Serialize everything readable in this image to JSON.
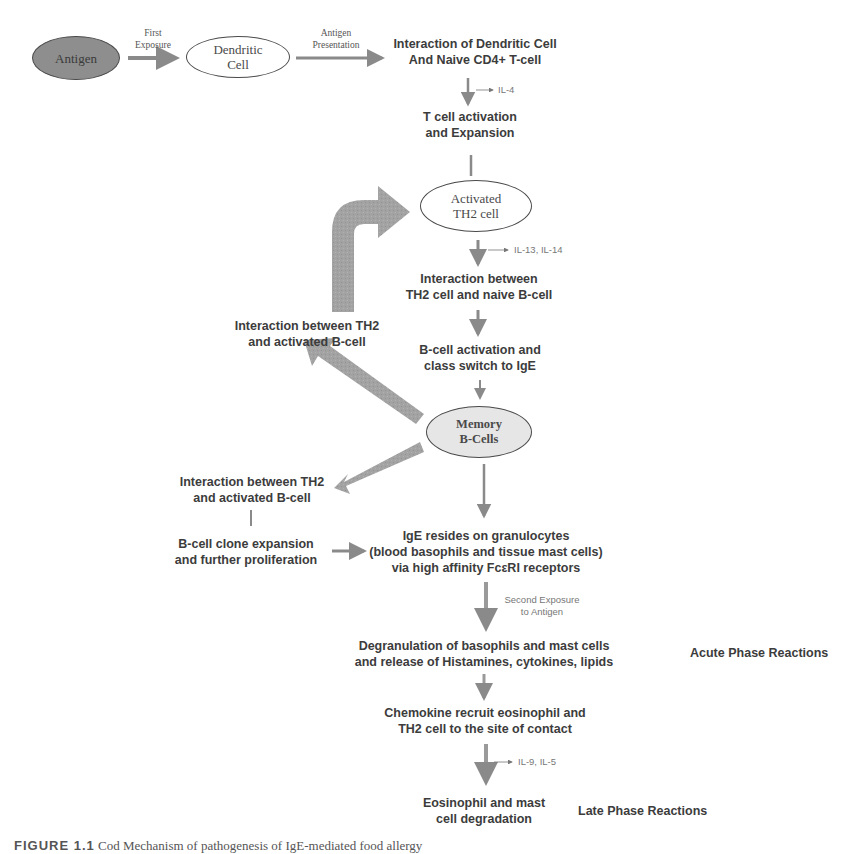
{
  "diagram": {
    "colors": {
      "arrow_fill": "#9a9a9a",
      "antigen_fill": "#8e8e8e",
      "memory_fill": "#e6e6e6",
      "text": "#3c3c3c"
    },
    "nodes": {
      "antigen": {
        "lines": [
          "Antigen"
        ],
        "shape": "ellipse-filled"
      },
      "dendritic_cell": {
        "lines": [
          "Dendritic",
          "Cell"
        ],
        "shape": "ellipse"
      },
      "interaction_dc_tcell": {
        "lines": [
          "Interaction of Dendritic Cell",
          "And Naive CD4+ T-cell"
        ]
      },
      "tcell_activation": {
        "lines": [
          "T cell activation",
          "and Expansion"
        ]
      },
      "activated_th2": {
        "lines": [
          "Activated",
          "TH2 cell"
        ],
        "shape": "ellipse"
      },
      "interaction_th2_naive_b": {
        "lines": [
          "Interaction between",
          "TH2 cell and naive B-cell"
        ]
      },
      "bcell_activation": {
        "lines": [
          "B-cell activation  and",
          "class switch to IgE"
        ]
      },
      "memory_bcells": {
        "lines": [
          "Memory",
          "B-Cells"
        ],
        "shape": "ellipse-filled-light"
      },
      "interaction_th2_activated_b_upper": {
        "lines": [
          "Interaction between TH2",
          "and activated B-cell"
        ]
      },
      "interaction_th2_activated_b_lower": {
        "lines": [
          "Interaction between TH2",
          "and activated B-cell"
        ]
      },
      "bcell_clone_expansion": {
        "lines": [
          "B-cell clone expansion",
          "and further proliferation"
        ]
      },
      "ige_granulocytes": {
        "lines": [
          "IgE resides on granulocytes",
          "(blood basophils and tissue mast cells)",
          "via high affinity FcεRI receptors"
        ]
      },
      "degranulation": {
        "lines": [
          "Degranulation of basophils and mast cells",
          "and release of Histamines, cytokines, lipids"
        ]
      },
      "chemokine_recruit": {
        "lines": [
          "Chemokine recruit eosinophil and",
          "TH2 cell to the site of contact"
        ]
      },
      "eosinophil_degradation": {
        "lines": [
          "Eosinophil and mast",
          "cell degradation"
        ]
      }
    },
    "edge_labels": {
      "first_exposure": [
        "First",
        "Exposure"
      ],
      "antigen_presentation": [
        "Antigen",
        "Presentation"
      ],
      "second_exposure": [
        "Second Exposure",
        "to Antigen"
      ]
    },
    "cytokines": {
      "il4": "IL-4",
      "il13_il14": "IL-13, IL-14",
      "il9_il5": "IL-9, IL-5"
    },
    "phase_labels": {
      "acute": "Acute Phase Reactions",
      "late": "Late Phase Reactions"
    },
    "edges": [
      {
        "from": "antigen",
        "to": "dendritic_cell",
        "label": "first_exposure"
      },
      {
        "from": "dendritic_cell",
        "to": "interaction_dc_tcell",
        "label": "antigen_presentation"
      },
      {
        "from": "interaction_dc_tcell",
        "to": "tcell_activation",
        "cytokine": "il4"
      },
      {
        "from": "tcell_activation",
        "to": "activated_th2"
      },
      {
        "from": "activated_th2",
        "to": "interaction_th2_naive_b",
        "cytokine": "il13_il14"
      },
      {
        "from": "interaction_th2_naive_b",
        "to": "bcell_activation"
      },
      {
        "from": "bcell_activation",
        "to": "memory_bcells"
      },
      {
        "from": "memory_bcells",
        "to": "interaction_th2_activated_b_upper"
      },
      {
        "from": "interaction_th2_activated_b_upper",
        "to": "activated_th2"
      },
      {
        "from": "memory_bcells",
        "to": "interaction_th2_activated_b_lower"
      },
      {
        "from": "interaction_th2_activated_b_lower",
        "to": "bcell_clone_expansion"
      },
      {
        "from": "bcell_clone_expansion",
        "to": "ige_granulocytes"
      },
      {
        "from": "memory_bcells",
        "to": "ige_granulocytes"
      },
      {
        "from": "ige_granulocytes",
        "to": "degranulation",
        "label": "second_exposure"
      },
      {
        "from": "degranulation",
        "to": "chemokine_recruit"
      },
      {
        "from": "chemokine_recruit",
        "to": "eosinophil_degradation",
        "cytokine": "il9_il5"
      }
    ]
  },
  "caption": {
    "figure_number": "FIGURE 1.1",
    "text": "Cod Mechanism of pathogenesis of IgE-mediated food allergy"
  }
}
